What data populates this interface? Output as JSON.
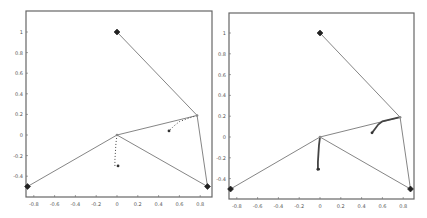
{
  "chart_data": [
    {
      "type": "line",
      "title": "",
      "xlabel": "",
      "ylabel": "",
      "xlim": [
        -0.88,
        0.9
      ],
      "ylim": [
        -0.58,
        1.2
      ],
      "xticks": [
        "-0.8",
        "-0.6",
        "-0.4",
        "-0.2",
        "0",
        "0.2",
        "0.4",
        "0.6",
        "0.8"
      ],
      "xtick_values": [
        -0.8,
        -0.6,
        -0.4,
        -0.2,
        0,
        0.2,
        0.4,
        0.6,
        0.8
      ],
      "yticks": [
        "1",
        "0.8",
        "0.6",
        "0.4",
        "0.2",
        "0",
        "-0.2",
        "-0.4"
      ],
      "ytick_values": [
        1,
        0.8,
        0.6,
        0.4,
        0.2,
        0,
        -0.2,
        -0.4
      ],
      "grid": false,
      "anchors": [
        {
          "x": 0.0,
          "y": 1.0
        },
        {
          "x": -0.86,
          "y": -0.5
        },
        {
          "x": 0.87,
          "y": -0.5
        }
      ],
      "links": [
        {
          "from": [
            0.0,
            1.0
          ],
          "to": [
            0.77,
            0.19
          ]
        },
        {
          "from": [
            0.77,
            0.19
          ],
          "to": [
            0.87,
            -0.5
          ]
        },
        {
          "from": [
            0.77,
            0.19
          ],
          "to": [
            0.0,
            0.0
          ]
        },
        {
          "from": [
            0.0,
            0.0
          ],
          "to": [
            -0.86,
            -0.5
          ]
        },
        {
          "from": [
            0.0,
            0.0
          ],
          "to": [
            0.87,
            -0.5
          ]
        }
      ],
      "series": [
        {
          "name": "trajectory-1",
          "style": "dotted",
          "x": [
            0.0,
            -0.01,
            -0.015,
            -0.02,
            -0.02
          ],
          "y": [
            0.0,
            -0.08,
            -0.16,
            -0.24,
            -0.3
          ]
        },
        {
          "name": "trajectory-2",
          "style": "dotted",
          "x": [
            0.77,
            0.68,
            0.6,
            0.55,
            0.5
          ],
          "y": [
            0.19,
            0.16,
            0.13,
            0.09,
            0.04
          ]
        }
      ],
      "markers": [
        {
          "x": 0.01,
          "y": -0.3
        },
        {
          "x": 0.5,
          "y": 0.04
        }
      ]
    },
    {
      "type": "line",
      "title": "",
      "xlabel": "",
      "ylabel": "",
      "xlim": [
        -0.88,
        0.9
      ],
      "ylim": [
        -0.58,
        1.2
      ],
      "xticks": [
        "-0.8",
        "-0.6",
        "-0.4",
        "-0.2",
        "0",
        "0.2",
        "0.4",
        "0.6",
        "0.8"
      ],
      "xtick_values": [
        -0.8,
        -0.6,
        -0.4,
        -0.2,
        0,
        0.2,
        0.4,
        0.6,
        0.8
      ],
      "yticks": [
        "1",
        "0.8",
        "0.6",
        "0.4",
        "0.2",
        "0",
        "-0.2",
        "-0.4"
      ],
      "ytick_values": [
        1,
        0.8,
        0.6,
        0.4,
        0.2,
        0,
        -0.2,
        -0.4
      ],
      "grid": false,
      "anchors": [
        {
          "x": 0.0,
          "y": 1.0
        },
        {
          "x": -0.86,
          "y": -0.5
        },
        {
          "x": 0.87,
          "y": -0.5
        }
      ],
      "links": [
        {
          "from": [
            0.0,
            1.0
          ],
          "to": [
            0.77,
            0.19
          ]
        },
        {
          "from": [
            0.77,
            0.19
          ],
          "to": [
            0.87,
            -0.5
          ]
        },
        {
          "from": [
            0.77,
            0.19
          ],
          "to": [
            0.0,
            0.0
          ]
        },
        {
          "from": [
            0.0,
            0.0
          ],
          "to": [
            -0.86,
            -0.5
          ]
        },
        {
          "from": [
            0.0,
            0.0
          ],
          "to": [
            0.87,
            -0.5
          ]
        }
      ],
      "series": [
        {
          "name": "trajectory-1",
          "style": "solid",
          "x": [
            0.0,
            -0.01,
            -0.015,
            -0.02,
            -0.02,
            0.0
          ],
          "y": [
            0.0,
            -0.08,
            -0.16,
            -0.24,
            -0.31,
            -0.31
          ]
        },
        {
          "name": "trajectory-2",
          "style": "solid",
          "x": [
            0.77,
            0.68,
            0.6,
            0.56,
            0.53,
            0.5
          ],
          "y": [
            0.19,
            0.17,
            0.15,
            0.12,
            0.08,
            0.04
          ]
        }
      ],
      "markers": [
        {
          "x": -0.02,
          "y": -0.31
        },
        {
          "x": 0.5,
          "y": 0.04
        }
      ]
    }
  ]
}
